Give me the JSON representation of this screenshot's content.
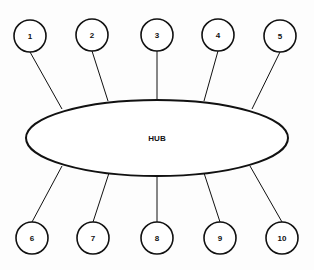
{
  "diagram": {
    "type": "star-topology",
    "hub": {
      "label": "HUB",
      "cx": 157,
      "cy": 138,
      "rx": 131,
      "ry": 38
    },
    "nodes": [
      {
        "id": 1,
        "label": "1",
        "cx": 30,
        "cy": 36,
        "r": 16,
        "ax": 62,
        "ay": 109
      },
      {
        "id": 2,
        "label": "2",
        "cx": 92,
        "cy": 35,
        "r": 16,
        "ax": 108,
        "ay": 101
      },
      {
        "id": 3,
        "label": "3",
        "cx": 157,
        "cy": 35,
        "r": 16,
        "ax": 157,
        "ay": 100
      },
      {
        "id": 4,
        "label": "4",
        "cx": 218,
        "cy": 35,
        "r": 16,
        "ax": 204,
        "ay": 101
      },
      {
        "id": 5,
        "label": "5",
        "cx": 280,
        "cy": 36,
        "r": 16,
        "ax": 252,
        "ay": 109
      },
      {
        "id": 6,
        "label": "6",
        "cx": 32,
        "cy": 238,
        "r": 16,
        "ax": 62,
        "ay": 166
      },
      {
        "id": 7,
        "label": "7",
        "cx": 93,
        "cy": 238,
        "r": 16,
        "ax": 109,
        "ay": 173
      },
      {
        "id": 8,
        "label": "8",
        "cx": 157,
        "cy": 238,
        "r": 16,
        "ax": 157,
        "ay": 176
      },
      {
        "id": 9,
        "label": "9",
        "cx": 220,
        "cy": 238,
        "r": 16,
        "ax": 204,
        "ay": 173
      },
      {
        "id": 10,
        "label": "10",
        "cx": 282,
        "cy": 238,
        "r": 16,
        "ax": 250,
        "ay": 166
      }
    ],
    "colors": {
      "stroke": "#111111",
      "fill": "#ffffff"
    }
  }
}
